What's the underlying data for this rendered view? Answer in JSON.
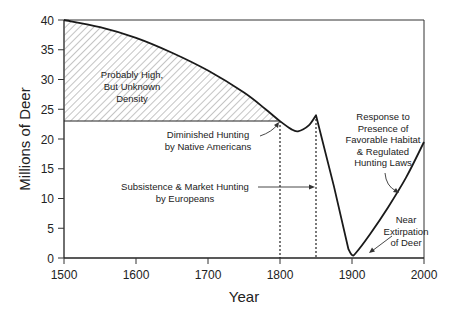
{
  "chart_data": {
    "type": "line",
    "title": "",
    "xlabel": "Year",
    "ylabel": "Millions of Deer",
    "xlim": [
      1500,
      2000
    ],
    "ylim": [
      0,
      40
    ],
    "x_ticks": [
      1500,
      1600,
      1700,
      1800,
      1900,
      2000
    ],
    "y_ticks": [
      0,
      5,
      10,
      15,
      20,
      25,
      30,
      35,
      40
    ],
    "grid": false,
    "series": [
      {
        "name": "Deer population",
        "x": [
          1500,
          1550,
          1600,
          1650,
          1700,
          1750,
          1780,
          1800,
          1815,
          1825,
          1840,
          1850,
          1875,
          1895,
          1900,
          1905,
          1925,
          1950,
          1975,
          2000
        ],
        "values": [
          40,
          38.8,
          37,
          34.5,
          31.5,
          27.8,
          25,
          23,
          21.7,
          21.3,
          22.3,
          24,
          12,
          1.5,
          0.5,
          0.8,
          4,
          8.5,
          13.5,
          19.5
        ]
      }
    ],
    "shaded_region": {
      "label": "Probably High, But Unknown Density",
      "x_from": 1500,
      "x_to": 1800,
      "y_floor": 23,
      "pattern": "diagonal-hatch"
    },
    "reference_lines": [
      {
        "type": "horizontal",
        "y": 23,
        "x_from": 1500,
        "x_to": 1800,
        "style": "solid"
      },
      {
        "type": "vertical",
        "x": 1800,
        "style": "dotted"
      },
      {
        "type": "vertical",
        "x": 1850,
        "style": "dotted"
      }
    ],
    "annotations": [
      {
        "text": [
          "Probably High,",
          "But Unknown",
          "Density"
        ],
        "target": "shaded region"
      },
      {
        "text": [
          "Diminished Hunting",
          "by Native Americans"
        ],
        "arrow_to": [
          1800,
          23
        ]
      },
      {
        "text": [
          "Subsistence & Market Hunting",
          "by Europeans"
        ],
        "arrow_to": [
          1850,
          12
        ]
      },
      {
        "text": [
          "Response to",
          "Presence of",
          "Favorable Habitat",
          "& Regulated",
          "Hunting Laws"
        ],
        "arrow_to": [
          1950,
          8.5
        ]
      },
      {
        "text": [
          "Near",
          "Extirpation",
          "of Deer"
        ],
        "arrow_to": [
          1905,
          0.8
        ]
      }
    ],
    "legend": null
  },
  "labels": {
    "xlabel": "Year",
    "ylabel": "Millions of Deer",
    "x_ticks": [
      "1500",
      "1600",
      "1700",
      "1800",
      "1900",
      "2000"
    ],
    "y_ticks": [
      "0",
      "5",
      "10",
      "15",
      "20",
      "25",
      "30",
      "35",
      "40"
    ],
    "ann_density": [
      "Probably High,",
      "But Unknown",
      "Density"
    ],
    "ann_native": [
      "Diminished Hunting",
      "by Native Americans"
    ],
    "ann_europe": [
      "Subsistence & Market Hunting",
      "by Europeans"
    ],
    "ann_response": [
      "Response to",
      "Presence of",
      "Favorable Habitat",
      "& Regulated",
      "Hunting Laws"
    ],
    "ann_extirp": [
      "Near",
      "Extirpation",
      "of Deer"
    ]
  }
}
